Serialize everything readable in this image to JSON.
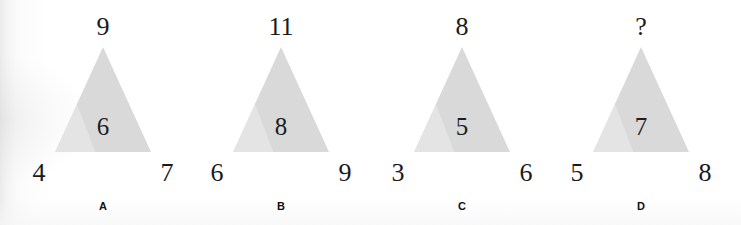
{
  "page": {
    "kind": "puzzle-figure-sheet",
    "background_color": "#ffffff",
    "triangle_fill_color": "#d9d9d9",
    "text_color": "#1a1a1a"
  },
  "figures": [
    {
      "label": "A",
      "apex": "9",
      "center": "6",
      "bottom_left": "4",
      "bottom_right": "7"
    },
    {
      "label": "B",
      "apex": "11",
      "center": "8",
      "bottom_left": "6",
      "bottom_right": "9"
    },
    {
      "label": "C",
      "apex": "8",
      "center": "5",
      "bottom_left": "3",
      "bottom_right": "6"
    },
    {
      "label": "D",
      "apex": "?",
      "center": "7",
      "bottom_left": "5",
      "bottom_right": "8"
    }
  ]
}
